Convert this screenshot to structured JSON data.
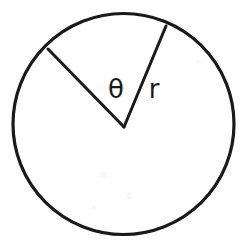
{
  "figure": {
    "kind": "geometry-diagram",
    "background_color": "#fefefe",
    "stroke_color": "#1a1a1a",
    "fill_color": "#ffffff",
    "canvas": {
      "width": 251,
      "height": 245
    }
  },
  "circle": {
    "name": "circle-outline",
    "center_x": 123.5,
    "center_y": 124,
    "radius": 110.5,
    "stroke_width": 3.2,
    "fill": "#ffffff",
    "stroke": "#1a1a1a"
  },
  "vertex": {
    "name": "angle-vertex",
    "x": 124,
    "y": 127
  },
  "radii": [
    {
      "name": "radius-left",
      "from_x": 124,
      "from_y": 127,
      "to_x": 48,
      "to_y": 49,
      "stroke_width": 3.0,
      "stroke": "#1a1a1a"
    },
    {
      "name": "radius-right",
      "from_x": 124,
      "from_y": 127,
      "to_x": 166,
      "to_y": 26,
      "stroke_width": 3.0,
      "stroke": "#1a1a1a"
    }
  ],
  "labels": {
    "theta": {
      "text": "θ",
      "x": 116,
      "y": 98,
      "font_size": 26,
      "color": "#1a1a1a"
    },
    "radius": {
      "text": "r",
      "x": 154,
      "y": 98,
      "font_size": 26,
      "color": "#1a1a1a"
    }
  },
  "chart_data": {
    "type": "diagram",
    "title": "",
    "elements": [
      {
        "element": "circle",
        "center": [
          123.5,
          124
        ],
        "radius": 110.5
      },
      {
        "element": "radius",
        "label": "left",
        "endpoints": [
          [
            124,
            127
          ],
          [
            48,
            49
          ]
        ]
      },
      {
        "element": "radius",
        "label": "right",
        "endpoints": [
          [
            124,
            127
          ],
          [
            166,
            26
          ]
        ]
      },
      {
        "element": "label",
        "text": "θ",
        "position": [
          116,
          90
        ],
        "meaning": "central angle"
      },
      {
        "element": "label",
        "text": "r",
        "position": [
          158,
          91
        ],
        "meaning": "radius length"
      }
    ],
    "annotations": [
      "θ",
      "r"
    ],
    "measured_sector_angle_degrees": 45
  }
}
